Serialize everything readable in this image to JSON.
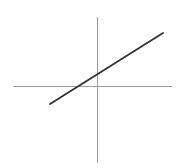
{
  "figure": {
    "title": "",
    "width": 181,
    "height": 168,
    "background_color": "#ffffff",
    "axis_color": "#9a9a9a",
    "line_color": "#333333",
    "axis_stroke_width": 1,
    "line_stroke_width": 1.8
  },
  "chart_data": {
    "type": "line",
    "title": "",
    "xlabel": "",
    "ylabel": "",
    "grid": false,
    "legend": null,
    "annotations": [],
    "axes": {
      "origin_px": [
        97,
        86
      ],
      "x_axis_px": {
        "x1": 13,
        "y1": 86,
        "x2": 172,
        "y2": 86
      },
      "y_axis_px": {
        "x1": 97,
        "y1": 17,
        "x2": 97,
        "y2": 163
      },
      "xlim": [
        -1.68,
        1.5
      ],
      "ylim": [
        -1.54,
        1.45
      ],
      "xticks": [],
      "yticks": [],
      "xticklabels": [],
      "yticklabels": []
    },
    "series": [
      {
        "name": "line",
        "kind": "straight-line",
        "points_px": [
          [
            50,
            104
          ],
          [
            163,
            33
          ]
        ],
        "x": [
          -0.94,
          1.32
        ],
        "y": [
          -0.38,
          1.12
        ],
        "slope": 0.63,
        "y_intercept": 0.21,
        "x_intercept": -0.46
      }
    ]
  }
}
